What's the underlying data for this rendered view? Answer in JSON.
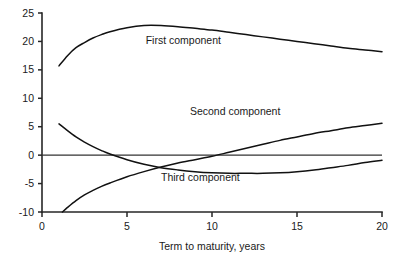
{
  "chart_data": {
    "type": "line",
    "title": "",
    "subtitle": "",
    "xlabel": "Term to maturity, years",
    "ylabel": "",
    "xlim": [
      0,
      20
    ],
    "ylim": [
      -10,
      25
    ],
    "xticks": [
      0,
      5,
      10,
      15,
      20
    ],
    "yticks": [
      -10,
      -5,
      0,
      5,
      10,
      15,
      20,
      25
    ],
    "xtick_labels": [
      "0",
      "5",
      "10",
      "15",
      "20"
    ],
    "ytick_labels": [
      "-10",
      "-5",
      "0",
      "5",
      "10",
      "15",
      "20",
      "25"
    ],
    "grid": false,
    "legend": "inline-annotations",
    "zero_line": 0,
    "series": [
      {
        "name": "First component",
        "label_position": {
          "x": 6.1,
          "y": 19.6
        },
        "x": [
          1.0,
          1.5,
          2.0,
          2.5,
          3.0,
          3.5,
          4.0,
          5.0,
          6.0,
          7.0,
          8.0,
          9.0,
          10.0,
          11.0,
          12.0,
          13.0,
          14.0,
          15.0,
          16.0,
          17.0,
          18.0,
          19.0,
          20.0
        ],
        "values": [
          15.7,
          17.5,
          18.9,
          19.8,
          20.6,
          21.2,
          21.7,
          22.4,
          22.8,
          22.8,
          22.6,
          22.3,
          22.0,
          21.6,
          21.2,
          20.8,
          20.4,
          20.0,
          19.6,
          19.2,
          18.8,
          18.5,
          18.2
        ]
      },
      {
        "name": "Second component",
        "label_position": {
          "x": 8.7,
          "y": 7.0
        },
        "x": [
          1.0,
          1.5,
          2.0,
          2.5,
          3.0,
          3.5,
          4.0,
          5.0,
          6.0,
          7.0,
          8.0,
          9.0,
          10.0,
          11.0,
          12.0,
          13.0,
          14.0,
          15.0,
          16.0,
          17.0,
          18.0,
          19.0,
          20.0
        ],
        "values": [
          5.5,
          4.3,
          3.2,
          2.3,
          1.5,
          0.8,
          0.2,
          -0.8,
          -1.6,
          -2.2,
          -2.6,
          -2.9,
          -3.1,
          -3.2,
          -3.2,
          -3.2,
          -3.1,
          -2.9,
          -2.6,
          -2.2,
          -1.8,
          -1.3,
          -0.9
        ]
      },
      {
        "name": "Third component",
        "label_position": {
          "x": 7.0,
          "y": -4.6
        },
        "x": [
          1.2,
          1.5,
          2.0,
          2.5,
          3.0,
          3.5,
          4.0,
          5.0,
          6.0,
          7.0,
          8.0,
          9.0,
          10.0,
          11.0,
          12.0,
          13.0,
          14.0,
          15.0,
          16.0,
          17.0,
          18.0,
          19.0,
          20.0
        ],
        "values": [
          -10.0,
          -9.2,
          -8.0,
          -7.0,
          -6.2,
          -5.5,
          -4.9,
          -3.8,
          -2.9,
          -2.1,
          -1.4,
          -0.8,
          -0.2,
          0.5,
          1.2,
          1.9,
          2.6,
          3.2,
          3.8,
          4.3,
          4.8,
          5.2,
          5.6
        ]
      }
    ]
  },
  "axes": {
    "x_axis_name": "term-to-maturity-axis",
    "y_axis_name": "component-loading-axis"
  }
}
